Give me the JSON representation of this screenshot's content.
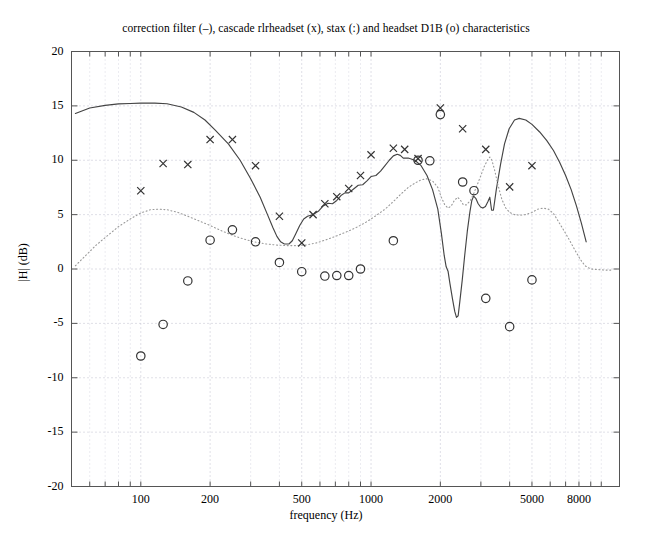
{
  "chart_data": {
    "type": "line",
    "title": "correction filter (–), cascade rlrheadset (x), stax (:) and headset D1B (o) characteristics",
    "xlabel": "frequency (Hz)",
    "ylabel": "|H| (dB)",
    "xscale": "log",
    "xlim": [
      50,
      12000
    ],
    "ylim": [
      -20,
      20
    ],
    "grid": true,
    "legend_position": "in-title",
    "ytick_labels": [
      "20",
      "15",
      "10",
      "5",
      "0",
      "-5",
      "-10",
      "-15",
      "-20"
    ],
    "ytick_values": [
      20,
      15,
      10,
      5,
      0,
      -5,
      -10,
      -15,
      -20
    ],
    "xtick_labels": [
      "100",
      "200",
      "500",
      "1000",
      "2000",
      "5000",
      "8000"
    ],
    "xtick_values": [
      100,
      200,
      500,
      1000,
      2000,
      5000,
      8000
    ],
    "xminor_values": [
      60,
      70,
      80,
      90,
      300,
      400,
      600,
      700,
      800,
      900,
      3000,
      4000,
      6000,
      7000,
      9000,
      10000
    ],
    "series": [
      {
        "name": "correction filter",
        "style": "solid-line",
        "marker": "none",
        "color": "#444444",
        "points": [
          [
            52,
            14.3
          ],
          [
            60,
            14.8
          ],
          [
            70,
            15.05
          ],
          [
            80,
            15.18
          ],
          [
            90,
            15.22
          ],
          [
            100,
            15.25
          ],
          [
            115,
            15.25
          ],
          [
            130,
            15.2
          ],
          [
            150,
            14.9
          ],
          [
            170,
            14.4
          ],
          [
            190,
            13.7
          ],
          [
            210,
            12.8
          ],
          [
            240,
            11.5
          ],
          [
            270,
            10.0
          ],
          [
            300,
            8.3
          ],
          [
            330,
            6.6
          ],
          [
            355,
            5.0
          ],
          [
            375,
            3.8
          ],
          [
            390,
            3.0
          ],
          [
            405,
            2.5
          ],
          [
            420,
            2.3
          ],
          [
            440,
            2.3
          ],
          [
            455,
            2.6
          ],
          [
            470,
            3.2
          ],
          [
            490,
            4.0
          ],
          [
            510,
            4.6
          ],
          [
            530,
            4.85
          ],
          [
            560,
            5.0
          ],
          [
            590,
            5.3
          ],
          [
            620,
            5.8
          ],
          [
            650,
            6.05
          ],
          [
            680,
            6.0
          ],
          [
            710,
            6.3
          ],
          [
            740,
            6.75
          ],
          [
            770,
            7.0
          ],
          [
            800,
            7.0
          ],
          [
            840,
            7.35
          ],
          [
            880,
            7.7
          ],
          [
            920,
            7.75
          ],
          [
            960,
            8.1
          ],
          [
            1000,
            8.5
          ],
          [
            1050,
            8.6
          ],
          [
            1100,
            9.0
          ],
          [
            1150,
            9.5
          ],
          [
            1200,
            10.0
          ],
          [
            1250,
            10.4
          ],
          [
            1300,
            10.55
          ],
          [
            1340,
            10.45
          ],
          [
            1380,
            10.2
          ],
          [
            1450,
            10.2
          ],
          [
            1550,
            10.0
          ],
          [
            1650,
            9.5
          ],
          [
            1750,
            8.6
          ],
          [
            1850,
            7.3
          ],
          [
            1950,
            5.5
          ],
          [
            2020,
            3.3
          ],
          [
            2080,
            1.2
          ],
          [
            2120,
            0.2
          ],
          [
            2160,
            -0.2
          ],
          [
            2200,
            -1.3
          ],
          [
            2260,
            -2.8
          ],
          [
            2310,
            -3.9
          ],
          [
            2350,
            -4.45
          ],
          [
            2390,
            -4.3
          ],
          [
            2430,
            -3.0
          ],
          [
            2490,
            -1.0
          ],
          [
            2550,
            1.2
          ],
          [
            2620,
            3.5
          ],
          [
            2690,
            5.3
          ],
          [
            2740,
            6.3
          ],
          [
            2790,
            6.7
          ],
          [
            2850,
            6.5
          ],
          [
            2920,
            6.0
          ],
          [
            2990,
            5.7
          ],
          [
            3060,
            5.6
          ],
          [
            3140,
            5.75
          ],
          [
            3220,
            6.2
          ],
          [
            3280,
            6.6
          ],
          [
            3340,
            5.4
          ],
          [
            3400,
            5.4
          ],
          [
            3500,
            7.3
          ],
          [
            3650,
            9.6
          ],
          [
            3800,
            11.5
          ],
          [
            3980,
            12.9
          ],
          [
            4200,
            13.7
          ],
          [
            4400,
            13.85
          ],
          [
            4700,
            13.7
          ],
          [
            5000,
            13.3
          ],
          [
            5400,
            12.6
          ],
          [
            5800,
            11.8
          ],
          [
            6200,
            10.9
          ],
          [
            6600,
            9.8
          ],
          [
            7000,
            8.6
          ],
          [
            7400,
            7.3
          ],
          [
            7800,
            5.8
          ],
          [
            8200,
            4.2
          ],
          [
            8600,
            2.5
          ]
        ]
      },
      {
        "name": "stax",
        "style": "dotted-line",
        "marker": "none",
        "color": "#9a9a9a",
        "points": [
          [
            52,
            0.3
          ],
          [
            58,
            1.3
          ],
          [
            64,
            2.2
          ],
          [
            72,
            3.1
          ],
          [
            80,
            3.9
          ],
          [
            90,
            4.6
          ],
          [
            100,
            5.15
          ],
          [
            110,
            5.45
          ],
          [
            120,
            5.5
          ],
          [
            130,
            5.45
          ],
          [
            145,
            5.2
          ],
          [
            160,
            4.85
          ],
          [
            180,
            4.4
          ],
          [
            200,
            4.0
          ],
          [
            225,
            3.5
          ],
          [
            250,
            3.1
          ],
          [
            280,
            2.75
          ],
          [
            310,
            2.5
          ],
          [
            350,
            2.3
          ],
          [
            390,
            2.2
          ],
          [
            430,
            2.15
          ],
          [
            470,
            2.15
          ],
          [
            520,
            2.2
          ],
          [
            580,
            2.4
          ],
          [
            640,
            2.7
          ],
          [
            700,
            3.0
          ],
          [
            780,
            3.4
          ],
          [
            860,
            3.8
          ],
          [
            950,
            4.3
          ],
          [
            1050,
            4.9
          ],
          [
            1150,
            5.5
          ],
          [
            1250,
            6.2
          ],
          [
            1350,
            6.9
          ],
          [
            1450,
            7.5
          ],
          [
            1550,
            7.9
          ],
          [
            1650,
            8.2
          ],
          [
            1750,
            8.3
          ],
          [
            1850,
            8.1
          ],
          [
            1950,
            7.5
          ],
          [
            2020,
            6.6
          ],
          [
            2090,
            5.9
          ],
          [
            2160,
            5.6
          ],
          [
            2230,
            5.8
          ],
          [
            2300,
            6.3
          ],
          [
            2380,
            6.6
          ],
          [
            2450,
            6.3
          ],
          [
            2520,
            5.9
          ],
          [
            2600,
            5.9
          ],
          [
            2700,
            6.3
          ],
          [
            2800,
            7.0
          ],
          [
            2900,
            7.8
          ],
          [
            3000,
            8.6
          ],
          [
            3100,
            9.4
          ],
          [
            3200,
            10.0
          ],
          [
            3280,
            10.3
          ],
          [
            3350,
            10.0
          ],
          [
            3450,
            9.0
          ],
          [
            3560,
            7.7
          ],
          [
            3700,
            6.4
          ],
          [
            3850,
            5.6
          ],
          [
            4000,
            5.2
          ],
          [
            4200,
            5.0
          ],
          [
            4450,
            4.95
          ],
          [
            4700,
            5.0
          ],
          [
            5000,
            5.2
          ],
          [
            5300,
            5.5
          ],
          [
            5600,
            5.6
          ],
          [
            5900,
            5.5
          ],
          [
            6200,
            5.1
          ],
          [
            6500,
            4.4
          ],
          [
            6900,
            3.5
          ],
          [
            7300,
            2.6
          ],
          [
            7700,
            1.7
          ],
          [
            8100,
            0.9
          ],
          [
            8500,
            0.3
          ],
          [
            9000,
            0.0
          ],
          [
            9600,
            -0.05
          ],
          [
            10400,
            -0.1
          ],
          [
            11200,
            -0.1
          ]
        ]
      },
      {
        "name": "cascade rlrheadset",
        "style": "markers-only",
        "marker": "x",
        "color": "#333333",
        "points": [
          [
            100,
            7.2
          ],
          [
            125,
            9.7
          ],
          [
            160,
            9.6
          ],
          [
            200,
            11.9
          ],
          [
            250,
            11.9
          ],
          [
            315,
            9.5
          ],
          [
            400,
            4.85
          ],
          [
            500,
            2.4
          ],
          [
            560,
            5.0
          ],
          [
            630,
            6.0
          ],
          [
            710,
            6.65
          ],
          [
            800,
            7.4
          ],
          [
            900,
            8.6
          ],
          [
            1000,
            10.5
          ],
          [
            1250,
            11.1
          ],
          [
            1400,
            11.0
          ],
          [
            1600,
            10.15
          ],
          [
            2000,
            14.8
          ],
          [
            2500,
            12.9
          ],
          [
            3150,
            11.0
          ],
          [
            4000,
            7.55
          ],
          [
            5000,
            9.5
          ]
        ]
      },
      {
        "name": "headset D1B",
        "style": "markers-only",
        "marker": "o",
        "color": "#333333",
        "points": [
          [
            100,
            -8.0
          ],
          [
            125,
            -5.1
          ],
          [
            160,
            -1.1
          ],
          [
            200,
            2.65
          ],
          [
            250,
            3.6
          ],
          [
            315,
            2.5
          ],
          [
            400,
            0.6
          ],
          [
            500,
            -0.25
          ],
          [
            630,
            -0.65
          ],
          [
            710,
            -0.6
          ],
          [
            800,
            -0.6
          ],
          [
            900,
            0.0
          ],
          [
            1250,
            2.6
          ],
          [
            1600,
            10.0
          ],
          [
            1800,
            9.95
          ],
          [
            2000,
            14.2
          ],
          [
            2500,
            8.0
          ],
          [
            2800,
            7.2
          ],
          [
            3150,
            -2.7
          ],
          [
            4000,
            -5.3
          ],
          [
            5000,
            -1.0
          ]
        ]
      }
    ]
  }
}
